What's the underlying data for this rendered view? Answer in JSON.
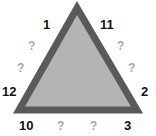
{
  "puzzle": {
    "shape": "triangle",
    "colors": {
      "stroke": "#5a5a5a",
      "fill": "#b4b4b4",
      "number": "#111111",
      "unknown": "#a8a8a8"
    },
    "numbers": {
      "top_left": "1",
      "top_right": "11",
      "mid_left": "12",
      "mid_right": "2",
      "bottom_left": "10",
      "bottom_right": "3"
    },
    "unknowns": {
      "left_upper": "?",
      "left_lower": "?",
      "right_upper": "?",
      "right_lower": "?",
      "bottom_left": "?",
      "bottom_right": "?"
    }
  }
}
